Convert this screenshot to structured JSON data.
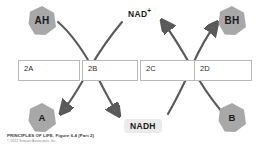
{
  "figure": {
    "boxes": [
      {
        "id": "2A",
        "label": "2A"
      },
      {
        "id": "2B",
        "label": "2B"
      },
      {
        "id": "2C",
        "label": "2C"
      },
      {
        "id": "2D",
        "label": "2D"
      }
    ],
    "nodes": [
      {
        "id": "AH",
        "label": "AH",
        "position": "top-left",
        "color": "#a8a8a8"
      },
      {
        "id": "BH",
        "label": "BH",
        "position": "top-right",
        "color": "#a8a8a8"
      },
      {
        "id": "A",
        "label": "A",
        "position": "bottom-left",
        "color": "#a8a8a8"
      },
      {
        "id": "B",
        "label": "B",
        "position": "bottom-right",
        "color": "#a8a8a8"
      }
    ],
    "cofactors": {
      "oxidized": "NAD",
      "oxidized_charge": "+",
      "reduced": "NADH"
    },
    "arrow_color": "#5a5a5a",
    "caption": {
      "title": "PRINCIPLES OF LIFE, Figure 6.4 (Part 2)",
      "copyright": "© 2012 Sinauer Associates, Inc."
    }
  }
}
